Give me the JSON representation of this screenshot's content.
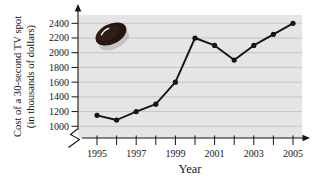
{
  "figure": {
    "ylabel_line1": "Cost of a 30-second TV spot",
    "ylabel_line2": "(in thousands of dollars)",
    "xlabel": "Year",
    "icon": "football-icon",
    "colors": {
      "plot_bg": "#e5e5e5",
      "gridline": "#bcbcbc",
      "axis": "#151515",
      "line": "#151515",
      "marker": "#151515",
      "football_body": "#241712",
      "football_lace": "#ffffff"
    }
  },
  "chart_data": {
    "type": "line",
    "title": "",
    "xlabel": "Year",
    "ylabel": "Cost of a 30-second TV spot (in thousands of dollars)",
    "x": [
      1995,
      1996,
      1997,
      1998,
      1999,
      2000,
      2001,
      2002,
      2003,
      2004,
      2005
    ],
    "values": [
      1150,
      1085,
      1200,
      1300,
      1600,
      2200,
      2100,
      1900,
      2100,
      2250,
      2400
    ],
    "series_name": "Cost of a 30-second TV spot",
    "x_ticks": [
      1995,
      1996,
      1997,
      1998,
      1999,
      2000,
      2001,
      2002,
      2003,
      2004,
      2005
    ],
    "x_labeled_ticks": [
      1995,
      1997,
      1999,
      2001,
      2003,
      2005
    ],
    "y_ticks": [
      1000,
      1200,
      1400,
      1600,
      1800,
      2000,
      2200,
      2400
    ],
    "xlim": [
      1995,
      2005
    ],
    "ylim": [
      1000,
      2400
    ],
    "grid": true,
    "axis_break_y": true,
    "legend": "none",
    "marker": "circle"
  }
}
